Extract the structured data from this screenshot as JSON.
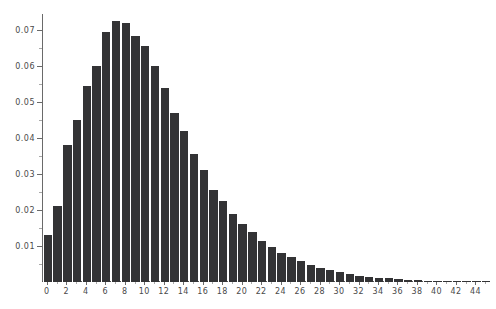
{
  "chart_data": {
    "type": "bar",
    "title": "",
    "xlabel": "",
    "ylabel": "",
    "xlim": [
      -0.5,
      45.5
    ],
    "ylim": [
      0,
      0.0745
    ],
    "grid": false,
    "legend": null,
    "bar_color": "#333335",
    "axis_color": "#6a6a6a",
    "categories": [
      0,
      1,
      2,
      3,
      4,
      5,
      6,
      7,
      8,
      9,
      10,
      11,
      12,
      13,
      14,
      15,
      16,
      17,
      18,
      19,
      20,
      21,
      22,
      23,
      24,
      25,
      26,
      27,
      28,
      29,
      30,
      31,
      32,
      33,
      34,
      35,
      36,
      37,
      38,
      39,
      40,
      41,
      42,
      43,
      44,
      45
    ],
    "values": [
      0.013,
      0.021,
      0.038,
      0.045,
      0.0545,
      0.06,
      0.0695,
      0.0725,
      0.072,
      0.0685,
      0.0655,
      0.06,
      0.054,
      0.047,
      0.042,
      0.0355,
      0.031,
      0.0255,
      0.0225,
      0.019,
      0.0162,
      0.0138,
      0.0115,
      0.0098,
      0.0082,
      0.0069,
      0.0058,
      0.0048,
      0.004,
      0.0033,
      0.0027,
      0.0022,
      0.0018,
      0.0015,
      0.0012,
      0.001,
      0.0008,
      0.0006,
      0.0005,
      0.0004,
      0.0003,
      0.0003,
      0.0002,
      0.0002,
      0.0001,
      0.0001
    ],
    "yticks": [
      0.01,
      0.02,
      0.03,
      0.04,
      0.05,
      0.06,
      0.07
    ],
    "ytick_labels": [
      "0.01",
      "0.02",
      "0.03",
      "0.04",
      "0.05",
      "0.06",
      "0.07"
    ],
    "yticks_minor": [
      0.005,
      0.015,
      0.025,
      0.035,
      0.045,
      0.055,
      0.065
    ],
    "xticks": [
      0,
      2,
      4,
      6,
      8,
      10,
      12,
      14,
      16,
      18,
      20,
      22,
      24,
      26,
      28,
      30,
      32,
      34,
      36,
      38,
      40,
      42,
      44
    ],
    "xtick_labels": [
      "0",
      "2",
      "4",
      "6",
      "8",
      "10",
      "12",
      "14",
      "16",
      "18",
      "20",
      "22",
      "24",
      "26",
      "28",
      "30",
      "32",
      "34",
      "36",
      "38",
      "40",
      "42",
      "44"
    ],
    "xticks_minor": [
      1,
      3,
      5,
      7,
      9,
      11,
      13,
      15,
      17,
      19,
      21,
      23,
      25,
      27,
      29,
      31,
      33,
      35,
      37,
      39,
      41,
      43,
      45
    ]
  }
}
